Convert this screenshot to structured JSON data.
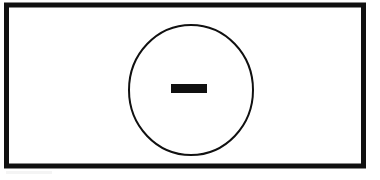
{
  "figure": {
    "caption": "Line drawing: a thick black rectangular border enclosing a thin circle outline with a solid horizontal dash at its center.",
    "background_color": "#ffffff",
    "ink_color": "#101010",
    "canvas": {
      "width": 380,
      "height": 180
    },
    "elements": {
      "frame": {
        "name": "Outer rectangle frame",
        "shape": "rectangle",
        "x": 6.5,
        "y": 5.0,
        "width": 357,
        "height": 161,
        "stroke_width": 5,
        "fill": "none",
        "stroke": "#101010"
      },
      "circle": {
        "name": "Circle outline",
        "shape": "ellipse",
        "center_x": 191,
        "center_y": 90,
        "radius_x": 62,
        "radius_y": 65,
        "stroke_width": 2,
        "fill": "none",
        "stroke": "#101010"
      },
      "bar": {
        "name": "Horizontal bar",
        "symbol": "minus",
        "shape": "rectangle",
        "x": 171,
        "y": 84,
        "width": 36,
        "height": 9,
        "fill": "#101010",
        "stroke_width": 0
      }
    }
  }
}
